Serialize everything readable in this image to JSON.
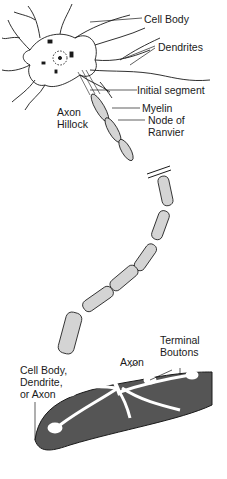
{
  "diagram": {
    "labels": {
      "cell_body_top": "Cell Body",
      "dendrites": "Dendrites",
      "initial_segment": "Initial segment",
      "axon_hillock_1": "Axon",
      "axon_hillock_2": "Hillock",
      "myelin": "Myelin",
      "node_1": "Node of",
      "node_2": "Ranvier",
      "terminal_1": "Terminal",
      "terminal_2": "Boutons",
      "axon_bottom": "Axon",
      "target_1": "Cell Body,",
      "target_2": "Dendrite,",
      "target_3": "or Axon"
    },
    "colors": {
      "line": "#1a1a1a",
      "myelin_fill": "#d4d4d4",
      "target_fill": "#555555",
      "background": "#ffffff"
    }
  }
}
